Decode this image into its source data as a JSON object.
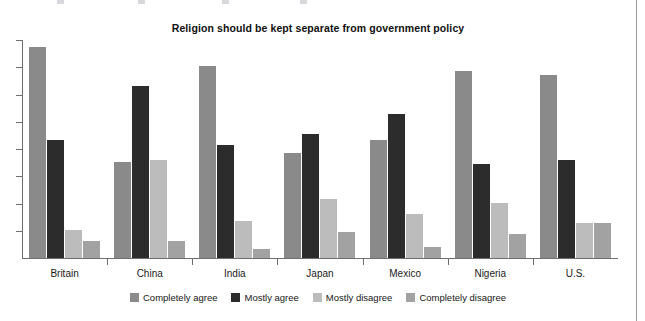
{
  "chart_data": {
    "type": "bar",
    "title": "Religion should be kept separate from government policy",
    "xlabel": "",
    "ylabel": "",
    "ylim": [
      0,
      100
    ],
    "grid": false,
    "legend_position": "bottom-center",
    "axis": {
      "y_tick_count": 8,
      "y_tick_labels": [],
      "y_ticks_labeled": false,
      "x_group_separators": true
    },
    "categories": [
      "Britain",
      "China",
      "India",
      "Japan",
      "Mexico",
      "Nigeria",
      "U.S."
    ],
    "series": [
      {
        "name": "Completely agree",
        "color": "#8a8a8a",
        "values": [
          97,
          44,
          88,
          48,
          54,
          86,
          84
        ]
      },
      {
        "name": "Mostly agree",
        "color": "#2c2c2c",
        "values": [
          54,
          79,
          52,
          57,
          66,
          43,
          45
        ]
      },
      {
        "name": "Mostly disagree",
        "color": "#bcbcbc",
        "values": [
          13,
          45,
          17,
          27,
          20,
          25,
          16
        ]
      },
      {
        "name": "Completely disagree",
        "color": "#a2a2a2",
        "values": [
          8,
          8,
          4,
          12,
          5,
          11,
          16
        ]
      }
    ]
  },
  "colors": {
    "completely_agree": "#8a8a8a",
    "mostly_agree": "#2c2c2c",
    "mostly_disagree": "#bcbcbc",
    "completely_disagree": "#a2a2a2",
    "axis": "#6e6e6e",
    "text": "#111111",
    "background": "#ffffff"
  }
}
